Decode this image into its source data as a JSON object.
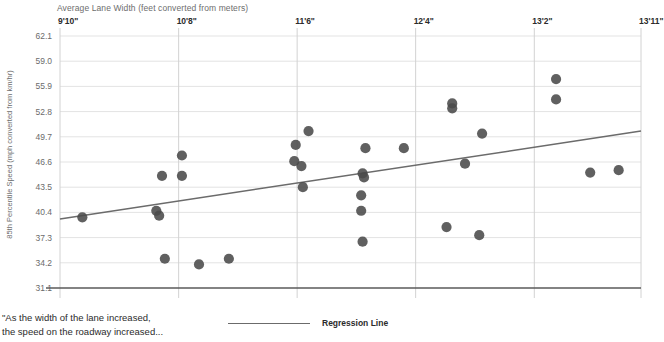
{
  "chart_data": {
    "type": "scatter",
    "title": "",
    "xlabel": "Average Lane Width (feet converted from meters)",
    "ylabel": "85th Percentile Speed (mph converted from km/hr)",
    "x_tick_labels": [
      "9'10\"",
      "10'8\"",
      "11'6\"",
      "12'4\"",
      "13'2\"",
      "13'11\""
    ],
    "x_tick_values": [
      9.833,
      10.667,
      11.5,
      12.333,
      13.167,
      13.917
    ],
    "y_tick_labels": [
      "62.1",
      "59.0",
      "55.9",
      "52.8",
      "49.7",
      "46.6",
      "43.5",
      "40.4",
      "37.3",
      "34.2",
      "31.1"
    ],
    "y_tick_values": [
      62.1,
      59.0,
      55.9,
      52.8,
      49.7,
      46.6,
      43.5,
      40.4,
      37.3,
      34.2,
      31.1
    ],
    "xlim": [
      9.833,
      13.917
    ],
    "ylim": [
      31.1,
      62.1
    ],
    "grid": true,
    "legend_position": "bottom-center",
    "series": [
      {
        "name": "Data Points",
        "type": "scatter",
        "color": "#4a4a4a",
        "marker": "circle",
        "points": [
          {
            "x": 9.99,
            "y": 39.8
          },
          {
            "x": 10.55,
            "y": 44.9
          },
          {
            "x": 10.69,
            "y": 47.4
          },
          {
            "x": 10.69,
            "y": 44.9
          },
          {
            "x": 10.51,
            "y": 40.6
          },
          {
            "x": 10.53,
            "y": 40.0
          },
          {
            "x": 10.57,
            "y": 34.7
          },
          {
            "x": 10.81,
            "y": 34.0
          },
          {
            "x": 11.02,
            "y": 34.7
          },
          {
            "x": 11.58,
            "y": 50.4
          },
          {
            "x": 11.49,
            "y": 48.7
          },
          {
            "x": 11.48,
            "y": 46.7
          },
          {
            "x": 11.53,
            "y": 46.1
          },
          {
            "x": 11.54,
            "y": 43.5
          },
          {
            "x": 11.98,
            "y": 48.3
          },
          {
            "x": 11.96,
            "y": 45.2
          },
          {
            "x": 11.97,
            "y": 44.7
          },
          {
            "x": 11.95,
            "y": 42.5
          },
          {
            "x": 11.95,
            "y": 40.6
          },
          {
            "x": 11.96,
            "y": 36.8
          },
          {
            "x": 12.25,
            "y": 48.3
          },
          {
            "x": 12.59,
            "y": 53.8
          },
          {
            "x": 12.59,
            "y": 53.2
          },
          {
            "x": 12.68,
            "y": 46.4
          },
          {
            "x": 12.8,
            "y": 50.1
          },
          {
            "x": 12.55,
            "y": 38.6
          },
          {
            "x": 12.78,
            "y": 37.6
          },
          {
            "x": 13.32,
            "y": 56.8
          },
          {
            "x": 13.32,
            "y": 54.3
          },
          {
            "x": 13.56,
            "y": 45.3
          },
          {
            "x": 13.76,
            "y": 45.6
          }
        ]
      },
      {
        "name": "Regression Line",
        "type": "line",
        "color": "#6b6b6b",
        "x_start": 9.833,
        "y_start": 39.6,
        "x_end": 13.917,
        "y_end": 50.4
      }
    ],
    "legend": [
      {
        "label": "Regression Line",
        "marker": "line",
        "color": "#6b6b6b"
      }
    ],
    "annotations": [
      {
        "text": "\"As the width of the lane increased,\nthe speed on the roadway increased...",
        "position": "bottom-left"
      }
    ]
  },
  "caption": {
    "text": "\"As the width of the lane increased,\nthe speed on the roadway increased..."
  },
  "legend": {
    "regression_label": "Regression Line"
  },
  "colors": {
    "point": "#4a4a4a",
    "line": "#6b6b6b",
    "grid": "#e3e3e3",
    "axis": "#5a5a5a",
    "tick_text": "#6b6b6b",
    "xtick_text": "#2b2b2b"
  }
}
